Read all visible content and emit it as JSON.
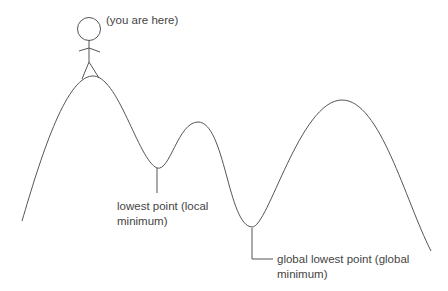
{
  "diagram": {
    "you_are_here": "(you are here)",
    "local_min_label": [
      "lowest point (local",
      "minimum)"
    ],
    "global_min_label": [
      "global lowest point (global",
      "minimum)"
    ],
    "line_color": "#555555",
    "text_color": "#444444"
  }
}
